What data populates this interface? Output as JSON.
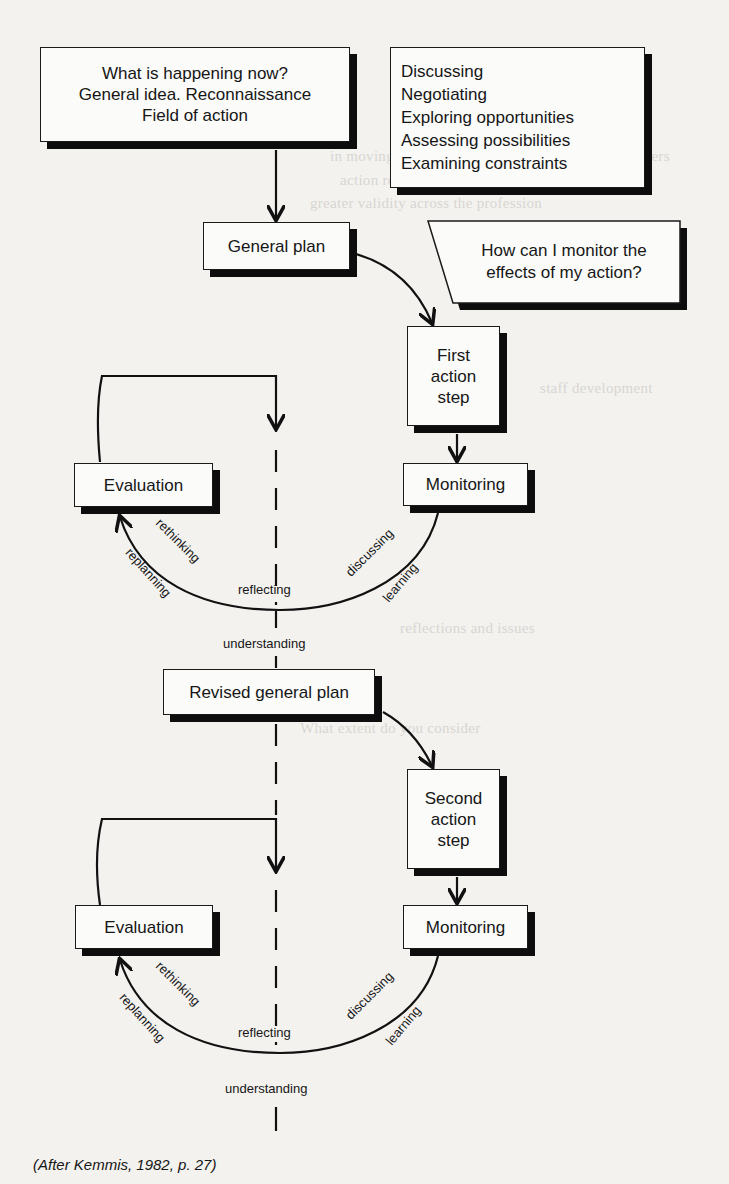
{
  "diagram": {
    "boxes": {
      "start": "What is happening now?\nGeneral idea. Reconnaissance\nField of action",
      "activities": [
        "Discussing",
        "Negotiating",
        "Exploring opportunities",
        "Assessing possibilities",
        "Examining constraints"
      ],
      "general_plan": "General plan",
      "question": "How can I monitor the\neffects of my action?",
      "first_action": "First\naction\nstep",
      "monitoring_1": "Monitoring",
      "evaluation_1": "Evaluation",
      "revised_plan": "Revised general plan",
      "second_action": "Second\naction\nstep",
      "monitoring_2": "Monitoring",
      "evaluation_2": "Evaluation"
    },
    "cycle_labels": {
      "rethinking": "rethinking",
      "replanning": "replanning",
      "reflecting": "reflecting",
      "discussing": "discussing",
      "learning": "learning",
      "understanding": "understanding"
    },
    "caption": "(After Kemmis, 1982, p. 27)"
  }
}
